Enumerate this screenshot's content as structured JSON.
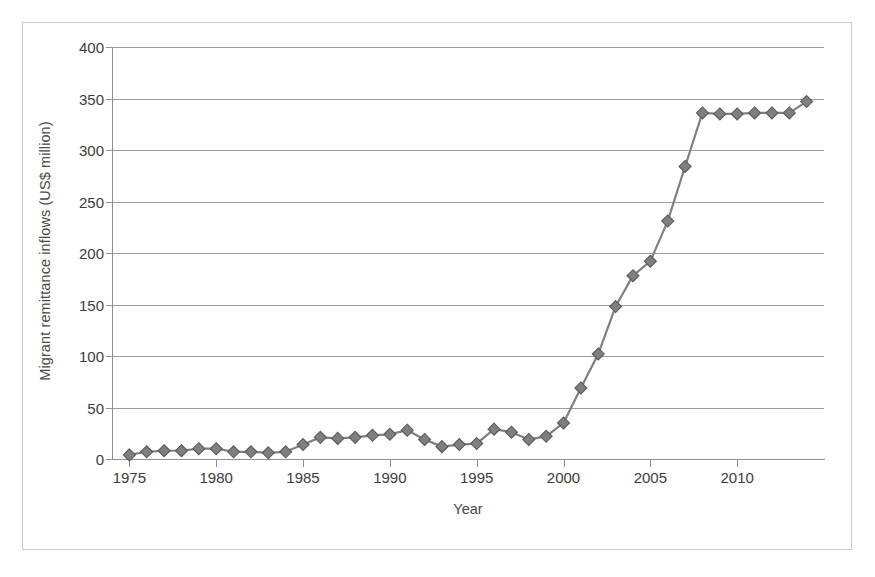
{
  "chart_data": {
    "type": "line",
    "title": "",
    "xlabel": "Year",
    "ylabel": "Migrant remittance inflows (US$ million)",
    "xlim": [
      1974,
      2015
    ],
    "ylim": [
      0,
      400
    ],
    "xticks": [
      1975,
      1980,
      1985,
      1990,
      1995,
      2000,
      2005,
      2010
    ],
    "yticks": [
      0,
      50,
      100,
      150,
      200,
      250,
      300,
      350,
      400
    ],
    "grid": true,
    "legend": false,
    "legend_position": "none",
    "marker": "diamond",
    "series_color": "#808080",
    "marker_fill": "#7f7f7f",
    "marker_edge": "#5a5a5a",
    "gridline_color": "#9d9d9d",
    "axis_color": "#8f8f8f",
    "background": "#ffffff",
    "x": [
      1975,
      1976,
      1977,
      1978,
      1979,
      1980,
      1981,
      1982,
      1983,
      1984,
      1985,
      1986,
      1987,
      1988,
      1989,
      1990,
      1991,
      1992,
      1993,
      1994,
      1995,
      1996,
      1997,
      1998,
      1999,
      2000,
      2001,
      2002,
      2003,
      2004,
      2005,
      2006,
      2007,
      2008,
      2009,
      2010,
      2011,
      2012,
      2013,
      2014
    ],
    "values": [
      4,
      7,
      8,
      8,
      10,
      10,
      7,
      7,
      6,
      7,
      14,
      21,
      20,
      21,
      23,
      24,
      28,
      19,
      12,
      14,
      15,
      29,
      26,
      19,
      22,
      35,
      69,
      102,
      148,
      178,
      192,
      231,
      284,
      336,
      335,
      335,
      336,
      336,
      336,
      347
    ],
    "series": [
      {
        "name": "Migrant remittance inflows",
        "values": [
          4,
          7,
          8,
          8,
          10,
          10,
          7,
          7,
          6,
          7,
          14,
          21,
          20,
          21,
          23,
          24,
          28,
          19,
          12,
          14,
          15,
          29,
          26,
          19,
          22,
          35,
          69,
          102,
          148,
          178,
          192,
          231,
          284,
          336,
          335,
          335,
          336,
          336,
          336,
          347
        ]
      }
    ],
    "ytick_labels": [
      "0",
      "50",
      "100",
      "150",
      "200",
      "250",
      "300",
      "350",
      "400"
    ],
    "xtick_labels": [
      "1975",
      "1980",
      "1985",
      "1990",
      "1995",
      "2000",
      "2005",
      "2010"
    ]
  }
}
